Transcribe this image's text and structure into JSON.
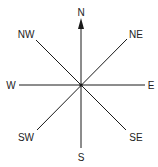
{
  "diagram": {
    "type": "compass-rose",
    "center": [
      81,
      85
    ],
    "line_color": "#1a1a1a",
    "north_arrow": true,
    "directions": [
      {
        "id": "N",
        "label": "N",
        "x": 81,
        "y": 16,
        "anchor": "middle"
      },
      {
        "id": "NE",
        "label": "NE",
        "x": 136,
        "y": 38,
        "anchor": "middle"
      },
      {
        "id": "E",
        "label": "E",
        "x": 151,
        "y": 89,
        "anchor": "middle"
      },
      {
        "id": "SE",
        "label": "SE",
        "x": 136,
        "y": 141,
        "anchor": "middle"
      },
      {
        "id": "S",
        "label": "S",
        "x": 81,
        "y": 161,
        "anchor": "middle"
      },
      {
        "id": "SW",
        "label": "SW",
        "x": 26,
        "y": 141,
        "anchor": "middle"
      },
      {
        "id": "W",
        "label": "W",
        "x": 11,
        "y": 89,
        "anchor": "middle"
      },
      {
        "id": "NW",
        "label": "NW",
        "x": 26,
        "y": 38,
        "anchor": "middle"
      }
    ]
  }
}
